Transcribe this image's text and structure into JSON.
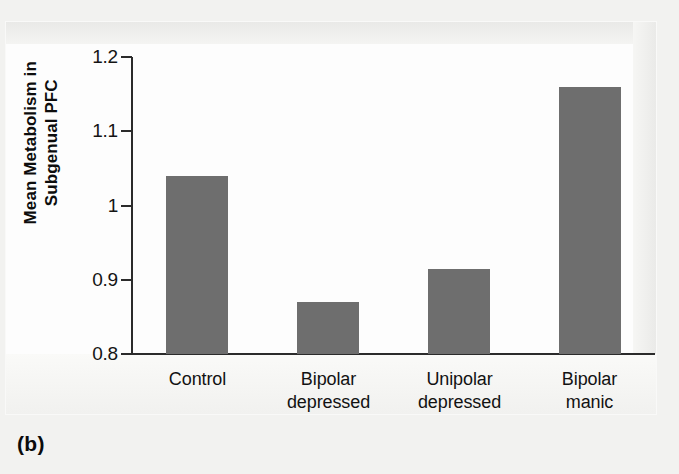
{
  "caption": "(b)",
  "chart_data": {
    "type": "bar",
    "title": "",
    "xlabel": "",
    "ylabel": "Mean Metabolism in Subgenual PFC",
    "ylabel_lines": [
      "Mean Metabolism in",
      "Subgenual PFC"
    ],
    "categories": [
      "Control",
      "Bipolar depressed",
      "Unipolar depressed",
      "Bipolar manic"
    ],
    "category_lines": [
      [
        "Control"
      ],
      [
        "Bipolar",
        "depressed"
      ],
      [
        "Unipolar",
        "depressed"
      ],
      [
        "Bipolar",
        "manic"
      ]
    ],
    "values": [
      1.04,
      0.87,
      0.915,
      1.16
    ],
    "ylim": [
      0.8,
      1.2
    ],
    "yticks": [
      0.8,
      0.9,
      1,
      1.1,
      1.2
    ],
    "ytick_labels": [
      "0.8",
      "0.9",
      "1",
      "1.1",
      "1.2"
    ],
    "grid": false,
    "legend": false,
    "bar_color": "#6e6e6e",
    "axis_color": "#2b2b2b",
    "background_color": "#fdfdfd"
  }
}
